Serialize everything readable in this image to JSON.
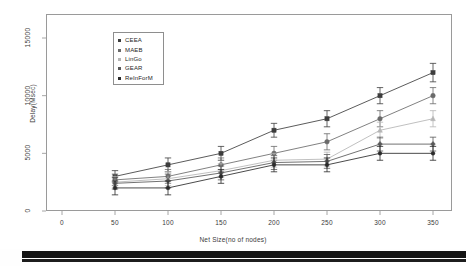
{
  "figure": {
    "background_color": "#ffffff",
    "frame_color": "#9a9a9a"
  },
  "chart_data": {
    "type": "line",
    "title": "",
    "subtitle": "",
    "xlabel": "Net Size(no of nodes)",
    "ylabel": "Delay(Msec)",
    "x": [
      50,
      100,
      150,
      200,
      250,
      300,
      350
    ],
    "xlim": [
      0,
      370
    ],
    "ylim": [
      0,
      16500
    ],
    "xticks": [
      0,
      50,
      100,
      150,
      200,
      250,
      300,
      350
    ],
    "xticklabels": [
      "0",
      "50",
      "100",
      "150",
      "200",
      "250",
      "300",
      "350"
    ],
    "yticks": [
      0,
      5000,
      10000,
      15000
    ],
    "yticklabels": [
      "0",
      "5000",
      "10000",
      "15000"
    ],
    "grid": false,
    "legend_position": "upper left",
    "error_bars": true,
    "series": [
      {
        "name": "CEEA",
        "color": "#3d3d3d",
        "marker": "square",
        "values": [
          3000,
          4000,
          5000,
          7000,
          8000,
          10000,
          12000
        ],
        "errors": [
          500,
          600,
          600,
          600,
          700,
          700,
          800
        ]
      },
      {
        "name": "MAEB",
        "color": "#6a6a6a",
        "marker": "circle",
        "values": [
          2700,
          3000,
          4000,
          5000,
          6000,
          8000,
          10000
        ],
        "errors": [
          500,
          600,
          600,
          600,
          700,
          700,
          700
        ]
      },
      {
        "name": "LinGo",
        "color": "#b5b5b5",
        "marker": "triangle",
        "values": [
          2500,
          2800,
          3500,
          4400,
          4500,
          7000,
          8000
        ],
        "errors": [
          500,
          600,
          600,
          600,
          600,
          700,
          700
        ]
      },
      {
        "name": "GEAR",
        "color": "#585858",
        "marker": "diamond",
        "values": [
          2400,
          2600,
          3300,
          4200,
          4300,
          5800,
          5800
        ],
        "errors": [
          500,
          600,
          600,
          600,
          600,
          600,
          600
        ]
      },
      {
        "name": "ReInForM",
        "color": "#2a2a2a",
        "marker": "dot",
        "values": [
          2000,
          2000,
          3000,
          4000,
          4000,
          5000,
          5000
        ],
        "errors": [
          600,
          600,
          600,
          600,
          600,
          600,
          600
        ]
      }
    ]
  },
  "legend": {
    "entries": [
      {
        "label": "CEEA",
        "color": "#3d3d3d"
      },
      {
        "label": "MAEB",
        "color": "#6a6a6a"
      },
      {
        "label": "LinGo",
        "color": "#b5b5b5"
      },
      {
        "label": "GEAR",
        "color": "#585858"
      },
      {
        "label": "ReInForM",
        "color": "#2a2a2a"
      }
    ]
  },
  "axes": {
    "y_title": "Delay(Msec)",
    "x_title": "Net Size(no of nodes)",
    "y_tick_labels": [
      "0",
      "5000",
      "10000",
      "15000"
    ],
    "x_tick_labels": [
      "0",
      "50",
      "100",
      "150",
      "200",
      "250",
      "300",
      "350"
    ]
  }
}
